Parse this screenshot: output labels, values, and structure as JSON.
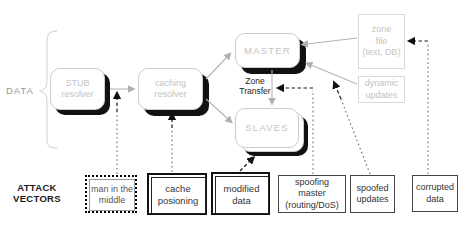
{
  "colors": {
    "box_border": "#cccccc",
    "box_text": "#c4c4c4",
    "shadow": "#111111",
    "connector": "#b4b4b4",
    "attack_dot": "#6e6e6e",
    "attack_dash": "#1a1a1a",
    "attack_text": "#333333",
    "label_text": "#1a1a1a",
    "data_label": "#969696",
    "pale_border": "#d9d9d9",
    "brace": "#dcdcdc",
    "bg": "#ffffff"
  },
  "labels": {
    "data": "DATA",
    "attack_vectors": "ATTACK\nVECTORS",
    "zone_transfer": "Zone\nTransfer"
  },
  "nodes": {
    "stub_resolver": "STUB\nresolver",
    "caching_resolver": "caching\nresolver",
    "master": "MASTER",
    "slaves": "SLAVES",
    "zone_file": "zone\nfile\n(text, DB)",
    "dynamic_updates": "dynamic\nupdates"
  },
  "attacks": [
    {
      "label": "man in the\nmiddle"
    },
    {
      "label": "cache\nposioning"
    },
    {
      "label": "modified\ndata"
    },
    {
      "label": "spoofing\nmaster\n(routing/DoS)"
    },
    {
      "label": "spoofed\nupdates"
    },
    {
      "label": "corrupted\ndata"
    }
  ]
}
